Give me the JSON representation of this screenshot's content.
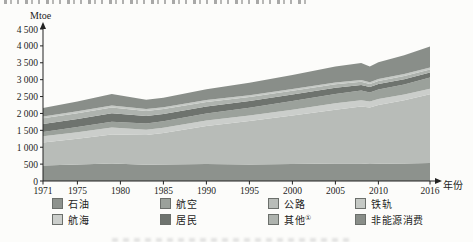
{
  "chart_data": {
    "type": "area",
    "stacked": true,
    "title": "",
    "ylabel": "Mtoe",
    "xlabel": "年份",
    "grid": false,
    "ylim": [
      0,
      4500
    ],
    "xlim": [
      1971,
      2016
    ],
    "y_ticks": [
      0,
      500,
      1000,
      1500,
      2000,
      2500,
      3000,
      3500,
      4000,
      4500
    ],
    "y_tick_labels": [
      "0",
      "500",
      "1 000",
      "1 500",
      "2 000",
      "2 500",
      "3 000",
      "3 500",
      "4 000",
      "4 500"
    ],
    "x_tick_years": [
      1971,
      1975,
      1980,
      1985,
      1990,
      1995,
      2000,
      2005,
      2010,
      2016
    ],
    "x_tick_labels": [
      "1971",
      "1975",
      "1980",
      "1985",
      "1990",
      "1995",
      "2000",
      "2005",
      "2010",
      "2016"
    ],
    "x": [
      1971,
      1975,
      1979,
      1983,
      1985,
      1990,
      1995,
      2000,
      2005,
      2008,
      2009,
      2010,
      2013,
      2016
    ],
    "series": [
      {
        "name": "石油",
        "color": "#8d928d",
        "values": [
          460,
          490,
          520,
          480,
          490,
          500,
          490,
          500,
          520,
          515,
          500,
          510,
          520,
          530
        ]
      },
      {
        "name": "公路",
        "color": "#b8bcb8",
        "values": [
          680,
          760,
          860,
          880,
          930,
          1130,
          1290,
          1440,
          1590,
          1690,
          1680,
          1740,
          1870,
          2040
        ]
      },
      {
        "name": "航海",
        "color": "#cbcecb",
        "values": [
          185,
          195,
          200,
          160,
          158,
          160,
          160,
          170,
          190,
          185,
          170,
          180,
          170,
          160
        ]
      },
      {
        "name": "航空",
        "color": "#9ba19b",
        "values": [
          130,
          150,
          175,
          180,
          190,
          210,
          230,
          260,
          280,
          285,
          270,
          280,
          300,
          330
        ]
      },
      {
        "name": "居民",
        "color": "#6e736e",
        "values": [
          230,
          240,
          252,
          225,
          218,
          210,
          200,
          190,
          180,
          165,
          160,
          158,
          154,
          150
        ]
      },
      {
        "name": "其他①",
        "color": "#aeb3ae",
        "values": [
          170,
          172,
          170,
          150,
          142,
          130,
          120,
          112,
          105,
          100,
          96,
          95,
          92,
          90
        ]
      },
      {
        "name": "铁轨",
        "color": "#c5c9c5",
        "values": [
          58,
          60,
          62,
          56,
          55,
          54,
          50,
          50,
          50,
          52,
          50,
          54,
          58,
          60
        ]
      },
      {
        "name": "非能源消费",
        "color": "#898e89",
        "values": [
          250,
          290,
          335,
          272,
          280,
          320,
          368,
          420,
          478,
          498,
          468,
          500,
          558,
          618
        ]
      }
    ],
    "legend": {
      "position": "bottom",
      "columns": 4,
      "items": [
        {
          "name": "石油",
          "color": "#8d928d"
        },
        {
          "name": "航空",
          "color": "#9ba19b"
        },
        {
          "name": "公路",
          "color": "#b8bcb8"
        },
        {
          "name": "铁轨",
          "color": "#c5c9c5"
        },
        {
          "name": "航海",
          "color": "#cbcecb"
        },
        {
          "name": "居民",
          "color": "#6e736e"
        },
        {
          "name": "其他",
          "superscript": "①",
          "color": "#aeb3ae"
        },
        {
          "name": "非能源消费",
          "color": "#898e89"
        }
      ]
    }
  }
}
